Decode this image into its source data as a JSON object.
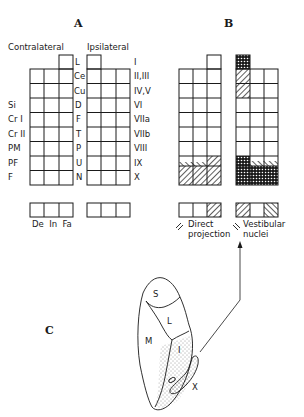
{
  "panels": {
    "a": {
      "letter": "A"
    },
    "b": {
      "letter": "B"
    },
    "c": {
      "letter": "C"
    }
  },
  "panel_a": {
    "side_headers": {
      "contralateral": "Contralateral",
      "ipsilateral": "Ipsilateral"
    },
    "center_labels": [
      "L",
      "Ce",
      "Cu",
      "D",
      "F",
      "T",
      "P",
      "U",
      "N"
    ],
    "left_labels": [
      {
        "row": 3,
        "text": "Si"
      },
      {
        "row": 4,
        "text": "Cr I"
      },
      {
        "row": 5,
        "text": "Cr II"
      },
      {
        "row": 6,
        "text": "PM"
      },
      {
        "row": 7,
        "text": "PF"
      },
      {
        "row": 8,
        "text": "F"
      }
    ],
    "right_labels": [
      "I",
      "II,III",
      "IV,V",
      "VI",
      "VIIa",
      "VIIb",
      "VIII",
      "IX",
      "X"
    ],
    "nuclei_labels": "De  In  Fa"
  },
  "panel_b": {
    "legend_direct": "Direct projection",
    "legend_direct_line1": "Direct",
    "legend_direct_line2": "projection",
    "legend_vestibular_line1": "Vestibular",
    "legend_vestibular_line2": "nuclei"
  },
  "panel_c": {
    "regions": [
      "S",
      "L",
      "M",
      "I",
      "X"
    ]
  },
  "colors": {
    "ink": "#1a1a1a",
    "background": "#ffffff"
  }
}
